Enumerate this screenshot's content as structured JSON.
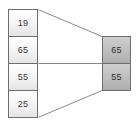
{
  "diagram": {
    "type": "array-mapping-diagram",
    "source_array": {
      "name": "source-array",
      "cells": [
        {
          "value": "19"
        },
        {
          "value": "65"
        },
        {
          "value": "55"
        },
        {
          "value": "25"
        }
      ]
    },
    "target_array": {
      "name": "target-array",
      "cells": [
        {
          "value": "65"
        },
        {
          "value": "55"
        }
      ]
    },
    "connectors": [
      {
        "name": "top-connector",
        "x1": 38,
        "y1": 9,
        "x2": 102,
        "y2": 36
      },
      {
        "name": "middle-connector",
        "x1": 38,
        "y1": 63,
        "x2": 102,
        "y2": 63
      },
      {
        "name": "bottom-connector",
        "x1": 38,
        "y1": 118,
        "x2": 102,
        "y2": 91
      }
    ],
    "colors": {
      "outline": "#6e6e6e",
      "source_fill": "#f5f5f5",
      "target_fill": "#bdbdbd",
      "connector": "#8a8a8a",
      "text": "#3a3a3a",
      "background": "#ffffff"
    }
  }
}
